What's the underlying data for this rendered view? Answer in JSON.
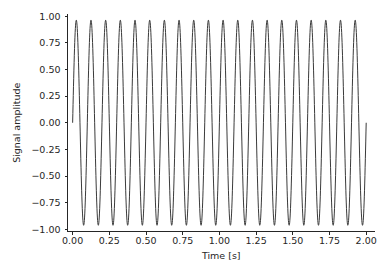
{
  "chart_data": {
    "type": "line",
    "title": "",
    "xlabel": "Time [s]",
    "ylabel": "Signal amplitude",
    "xlim": [
      -0.035,
      2.06
    ],
    "ylim": [
      -1.02,
      1.02
    ],
    "xticks": [
      0.0,
      0.25,
      0.5,
      0.75,
      1.0,
      1.25,
      1.5,
      1.75,
      2.0
    ],
    "xtick_labels": [
      "0.00",
      "0.25",
      "0.50",
      "0.75",
      "1.00",
      "1.25",
      "1.50",
      "1.75",
      "2.00"
    ],
    "yticks": [
      1.0,
      0.75,
      0.5,
      0.25,
      0.0,
      -0.25,
      -0.5,
      -0.75,
      -1.0
    ],
    "ytick_labels": [
      "1.00",
      "0.75",
      "0.50",
      "0.25",
      "0.00",
      "−0.25",
      "−0.50",
      "−0.75",
      "−1.00"
    ],
    "grid": false,
    "legend": false,
    "spines": [
      "left",
      "bottom"
    ],
    "series": [
      {
        "name": "signal",
        "color": "#3a3a3a",
        "linewidth": 1.0,
        "waveform": "sine",
        "amplitude": 0.962,
        "frequency_hz": 10.0,
        "phase": 0.0,
        "t_start": 0.0,
        "t_end": 2.0,
        "sample_count": 1400,
        "y_start": 0.0,
        "y_end": -0.6
      }
    ]
  },
  "figure": {
    "background_color": "#ffffff",
    "text_color": "#262626",
    "axis_color": "#262626"
  }
}
